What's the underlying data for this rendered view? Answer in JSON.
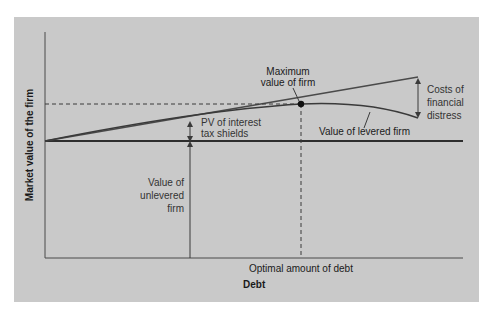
{
  "diagram": {
    "type": "trade-off theory of capital structure",
    "axes": {
      "y_label": "Market value of the firm",
      "x_label": "Debt",
      "x_marker_label": "Optimal amount of debt"
    },
    "annotations": {
      "max_value_line1": "Maximum",
      "max_value_line2": "value of firm",
      "pv_line1": "PV of interest",
      "pv_line2": "tax shields",
      "unlevered_line1": "Value of",
      "unlevered_line2": "unlevered",
      "unlevered_line3": "firm",
      "costs_line1": "Costs of",
      "costs_line2": "financial",
      "costs_line3": "distress",
      "levered_curve": "Value of levered firm"
    },
    "colors": {
      "panel_background": "#c9c9c9",
      "lines": "#3a3a3a",
      "text": "#333333"
    }
  }
}
